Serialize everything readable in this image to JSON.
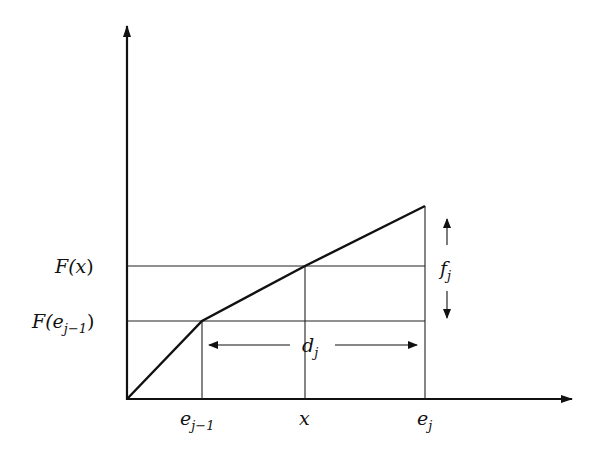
{
  "diagram": {
    "type": "piecewise-linear-function",
    "colors": {
      "stroke": "#111111",
      "background": "#ffffff"
    },
    "axes": {
      "origin": [
        127,
        399
      ],
      "y_axis_top": [
        127,
        25
      ],
      "x_axis_end": [
        573,
        399
      ]
    },
    "curve_points": [
      [
        127,
        399
      ],
      [
        202,
        321
      ],
      [
        305,
        266
      ],
      [
        425,
        206
      ]
    ],
    "y_labels": {
      "F_x": {
        "base": "F(",
        "var": "x",
        "close": ")"
      },
      "F_e_jm1": {
        "base": "F(",
        "var": "e",
        "sub": "j−1",
        "close": ")"
      }
    },
    "x_labels": {
      "e_jm1": {
        "var": "e",
        "sub": "j−1"
      },
      "x": {
        "var": "x"
      },
      "e_j": {
        "var": "e",
        "sub": "j"
      }
    },
    "annotations": {
      "d_j": {
        "var": "d",
        "sub": "j"
      },
      "f_j": {
        "var": "f",
        "sub": "j"
      }
    }
  }
}
